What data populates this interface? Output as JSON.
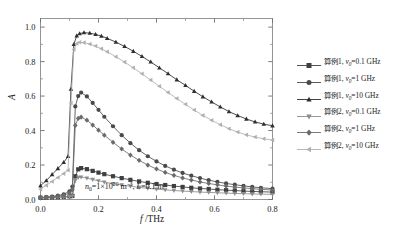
{
  "chart_data": {
    "type": "line",
    "title": "",
    "xlabel": "f /THz",
    "ylabel": "A",
    "xlim": [
      0.0,
      0.8
    ],
    "ylim": [
      0.0,
      1.05
    ],
    "xticks": [
      0.0,
      0.2,
      0.4,
      0.6,
      0.8
    ],
    "xticklabels": [
      "0.0",
      "0.2",
      "0.4",
      "0.6",
      "0.8"
    ],
    "yticks": [
      0.0,
      0.2,
      0.4,
      0.6,
      0.8,
      1.0
    ],
    "yticklabels": [
      "0.0",
      "0.2",
      "0.4",
      "0.6",
      "0.8",
      "1.0"
    ],
    "xminor": [
      0.1,
      0.3,
      0.5,
      0.7
    ],
    "yminor": [
      0.1,
      0.3,
      0.5,
      0.7,
      0.9
    ],
    "grid": false,
    "legend_position": "right-outside",
    "annotation": "n0=1×10^20 m^-3, L=0.1 m",
    "annotation_parts": {
      "n_symbol": "n",
      "n_sub": "0",
      "eq1": "=1×10",
      "exp1": "20",
      "unit1": " m",
      "exp2": "−3",
      "sep": ", ",
      "L_symbol": "L",
      "eq2": "=0.1 m"
    },
    "series": [
      {
        "name": "算例1, ν0=0.1 GHz",
        "case_label": "算例1",
        "nu_symbol": "ν",
        "nu_sub": "0",
        "nu_value": "=0.1 GHz",
        "marker": "square",
        "color": "#3f3f3f",
        "x": [
          0.0,
          0.02,
          0.04,
          0.06,
          0.08,
          0.1,
          0.11,
          0.12,
          0.13,
          0.14,
          0.16,
          0.18,
          0.2,
          0.22,
          0.25,
          0.28,
          0.31,
          0.34,
          0.37,
          0.4,
          0.43,
          0.46,
          0.49,
          0.52,
          0.55,
          0.58,
          0.61,
          0.64,
          0.67,
          0.7,
          0.73,
          0.76,
          0.8
        ],
        "y": [
          0.01,
          0.011,
          0.012,
          0.013,
          0.015,
          0.018,
          0.021,
          0.135,
          0.175,
          0.182,
          0.176,
          0.166,
          0.156,
          0.147,
          0.135,
          0.124,
          0.114,
          0.105,
          0.097,
          0.09,
          0.084,
          0.078,
          0.073,
          0.068,
          0.064,
          0.061,
          0.057,
          0.054,
          0.052,
          0.049,
          0.047,
          0.045,
          0.043
        ]
      },
      {
        "name": "算例1, ν0=1 GHz",
        "case_label": "算例1",
        "nu_symbol": "ν",
        "nu_sub": "0",
        "nu_value": "=1 GHz",
        "marker": "circle",
        "color": "#4a4a4a",
        "x": [
          0.0,
          0.02,
          0.04,
          0.06,
          0.08,
          0.1,
          0.11,
          0.12,
          0.13,
          0.14,
          0.16,
          0.18,
          0.2,
          0.22,
          0.25,
          0.28,
          0.31,
          0.34,
          0.37,
          0.4,
          0.43,
          0.46,
          0.49,
          0.52,
          0.55,
          0.58,
          0.61,
          0.64,
          0.67,
          0.7,
          0.73,
          0.76,
          0.8
        ],
        "y": [
          0.012,
          0.014,
          0.017,
          0.022,
          0.03,
          0.048,
          0.075,
          0.54,
          0.6,
          0.62,
          0.598,
          0.56,
          0.52,
          0.48,
          0.425,
          0.373,
          0.327,
          0.286,
          0.251,
          0.221,
          0.195,
          0.173,
          0.154,
          0.138,
          0.124,
          0.112,
          0.102,
          0.093,
          0.086,
          0.079,
          0.073,
          0.068,
          0.063
        ]
      },
      {
        "name": "算例1, ν0=10 GHz",
        "case_label": "算例1",
        "nu_symbol": "ν",
        "nu_sub": "0",
        "nu_value": "=10 GHz",
        "marker": "triangle-up",
        "color": "#2e2e2e",
        "x": [
          0.0,
          0.02,
          0.04,
          0.06,
          0.08,
          0.095,
          0.105,
          0.115,
          0.125,
          0.135,
          0.15,
          0.17,
          0.19,
          0.21,
          0.23,
          0.26,
          0.29,
          0.32,
          0.35,
          0.38,
          0.41,
          0.44,
          0.47,
          0.5,
          0.53,
          0.56,
          0.59,
          0.62,
          0.65,
          0.68,
          0.71,
          0.74,
          0.77,
          0.8
        ],
        "y": [
          0.08,
          0.11,
          0.145,
          0.18,
          0.215,
          0.25,
          0.64,
          0.9,
          0.95,
          0.962,
          0.968,
          0.965,
          0.958,
          0.948,
          0.935,
          0.913,
          0.888,
          0.86,
          0.83,
          0.798,
          0.764,
          0.73,
          0.695,
          0.662,
          0.628,
          0.596,
          0.566,
          0.537,
          0.51,
          0.487,
          0.467,
          0.45,
          0.437,
          0.428
        ]
      },
      {
        "name": "算例2, ν0=0.1 GHz",
        "case_label": "算例2",
        "nu_symbol": "ν",
        "nu_sub": "0",
        "nu_value": "=0.1 GHz",
        "marker": "triangle-down",
        "color": "#8c8c8c",
        "x": [
          0.0,
          0.02,
          0.04,
          0.06,
          0.08,
          0.1,
          0.11,
          0.12,
          0.13,
          0.14,
          0.16,
          0.18,
          0.2,
          0.22,
          0.25,
          0.28,
          0.31,
          0.34,
          0.37,
          0.4,
          0.43,
          0.46,
          0.49,
          0.52,
          0.55,
          0.58,
          0.61,
          0.64,
          0.67,
          0.7,
          0.73,
          0.76,
          0.8
        ],
        "y": [
          0.008,
          0.009,
          0.01,
          0.011,
          0.013,
          0.016,
          0.019,
          0.11,
          0.128,
          0.13,
          0.124,
          0.116,
          0.108,
          0.101,
          0.092,
          0.084,
          0.077,
          0.07,
          0.065,
          0.06,
          0.056,
          0.052,
          0.049,
          0.046,
          0.043,
          0.041,
          0.039,
          0.037,
          0.035,
          0.034,
          0.032,
          0.031,
          0.03
        ]
      },
      {
        "name": "算例2, ν0=1 GHz",
        "case_label": "算例2",
        "nu_symbol": "ν",
        "nu_sub": "0",
        "nu_value": "=1 GHz",
        "marker": "diamond",
        "color": "#6b6b6b",
        "x": [
          0.0,
          0.02,
          0.04,
          0.06,
          0.08,
          0.1,
          0.11,
          0.12,
          0.13,
          0.14,
          0.16,
          0.18,
          0.2,
          0.22,
          0.25,
          0.28,
          0.31,
          0.34,
          0.37,
          0.4,
          0.43,
          0.46,
          0.49,
          0.52,
          0.55,
          0.58,
          0.61,
          0.64,
          0.67,
          0.7,
          0.73,
          0.76,
          0.8
        ],
        "y": [
          0.01,
          0.012,
          0.014,
          0.018,
          0.024,
          0.038,
          0.058,
          0.43,
          0.47,
          0.478,
          0.46,
          0.432,
          0.402,
          0.373,
          0.332,
          0.293,
          0.258,
          0.227,
          0.2,
          0.177,
          0.157,
          0.14,
          0.125,
          0.113,
          0.102,
          0.093,
          0.085,
          0.078,
          0.072,
          0.067,
          0.063,
          0.059,
          0.055
        ]
      },
      {
        "name": "算例2, ν0=10 GHz",
        "case_label": "算例2",
        "nu_symbol": "ν",
        "nu_sub": "0",
        "nu_value": "=10 GHz",
        "marker": "triangle-left",
        "color": "#b0b0b0",
        "x": [
          0.0,
          0.02,
          0.04,
          0.06,
          0.08,
          0.095,
          0.105,
          0.115,
          0.125,
          0.135,
          0.15,
          0.17,
          0.19,
          0.21,
          0.23,
          0.26,
          0.29,
          0.32,
          0.35,
          0.38,
          0.41,
          0.44,
          0.47,
          0.5,
          0.53,
          0.56,
          0.59,
          0.62,
          0.65,
          0.68,
          0.71,
          0.74,
          0.77,
          0.8
        ],
        "y": [
          0.06,
          0.082,
          0.105,
          0.128,
          0.15,
          0.17,
          0.56,
          0.87,
          0.905,
          0.912,
          0.91,
          0.902,
          0.89,
          0.875,
          0.857,
          0.828,
          0.797,
          0.764,
          0.729,
          0.693,
          0.657,
          0.621,
          0.586,
          0.552,
          0.519,
          0.488,
          0.46,
          0.434,
          0.411,
          0.391,
          0.375,
          0.362,
          0.352,
          0.345
        ]
      }
    ]
  }
}
